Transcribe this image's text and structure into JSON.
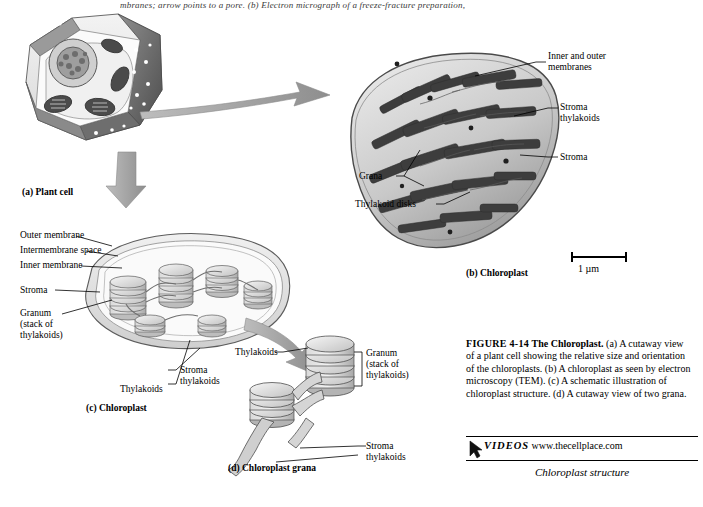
{
  "page": {
    "running_head": "mbranes; arrow points to a pore. (b) Electron micrograph of a freeze-fracture preparation,",
    "figure": {
      "number": "FIGURE 4-14",
      "title": "The Chloroplast.",
      "body": "(a) A cutaway view of a plant cell showing the relative size and orientation of the chloroplasts. (b) A chloroplast as seen by electron microscopy (TEM). (c) A schematic illustration of chloroplast structure. (d) A cutaway view of two grana.",
      "media_tag": "VIDEOS",
      "media_url": "www.thecellplace.com",
      "media_caption": "Chloroplast structure"
    },
    "panels": {
      "a": {
        "caption_letter": "(a)",
        "caption_text": "Plant cell"
      },
      "b": {
        "caption_letter": "(b)",
        "caption_text": "Chloroplast",
        "scale_label": "1 µm",
        "labels": [
          "Inner and outer\nmembranes",
          "Stroma\nthylakoids",
          "Stroma",
          "Grana",
          "Thylakoid disks"
        ]
      },
      "c": {
        "caption_letter": "(c)",
        "caption_text": "Chloroplast",
        "labels": [
          "Outer membrane",
          "Intermembrane space",
          "Inner membrane",
          "Stroma",
          "Granum\n(stack of\nthylakoids)",
          "Stroma\nthylakoids",
          "Thylakoids"
        ]
      },
      "d": {
        "caption_letter": "(d)",
        "caption_text": "Chloroplast grana",
        "labels": [
          "Thylakoids",
          "Granum\n(stack of\nthylakoids)",
          "Stroma\nthylakoids"
        ]
      }
    }
  }
}
